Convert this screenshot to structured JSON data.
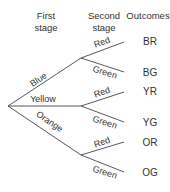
{
  "headers": {
    "first_stage_line1": "First",
    "first_stage_line2": "stage",
    "second_stage_line1": "Second",
    "second_stage_line2": "stage",
    "outcomes": "Outcomes"
  },
  "first_stage": [
    {
      "label": "Blue"
    },
    {
      "label": "Yellow"
    },
    {
      "label": "Orange"
    }
  ],
  "second_stage": [
    {
      "label": "Red"
    },
    {
      "label": "Green"
    },
    {
      "label": "Red"
    },
    {
      "label": "Green"
    },
    {
      "label": "Red"
    },
    {
      "label": "Green"
    }
  ],
  "outcomes": [
    "BR",
    "BG",
    "YR",
    "YG",
    "OR",
    "OG"
  ]
}
